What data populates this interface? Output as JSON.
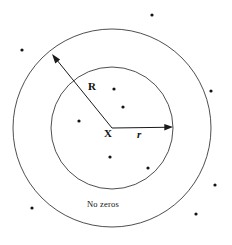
{
  "figure": {
    "annotation_label": "No zeros",
    "labels": {
      "outer_radius": "R",
      "inner_radius": "r",
      "center": "X"
    },
    "colors": {
      "circle_stroke": "#3a3a3a",
      "arrow": "#1a1a1a",
      "dot": "#141414",
      "background": "#ffffff",
      "text": "#111111"
    },
    "geometry": {
      "center": {
        "x": 112,
        "y": 128
      },
      "outer_circle_radius": 99,
      "inner_circle_radius": 61,
      "outer_arrow_tip": {
        "x": 52,
        "y": 54
      },
      "inner_arrow_tip": {
        "x": 173,
        "y": 127
      }
    },
    "dots": [
      {
        "x": 152,
        "y": 15,
        "region": "outside"
      },
      {
        "x": 22,
        "y": 50,
        "region": "outside"
      },
      {
        "x": 211,
        "y": 91,
        "region": "outside"
      },
      {
        "x": 114,
        "y": 89,
        "region": "inside"
      },
      {
        "x": 123,
        "y": 107,
        "region": "inside"
      },
      {
        "x": 79,
        "y": 121,
        "region": "inside"
      },
      {
        "x": 110,
        "y": 157,
        "region": "inside"
      },
      {
        "x": 148,
        "y": 168,
        "region": "inside"
      },
      {
        "x": 215,
        "y": 185,
        "region": "outside"
      },
      {
        "x": 32,
        "y": 208,
        "region": "outside"
      },
      {
        "x": 196,
        "y": 214,
        "region": "outside"
      }
    ]
  }
}
